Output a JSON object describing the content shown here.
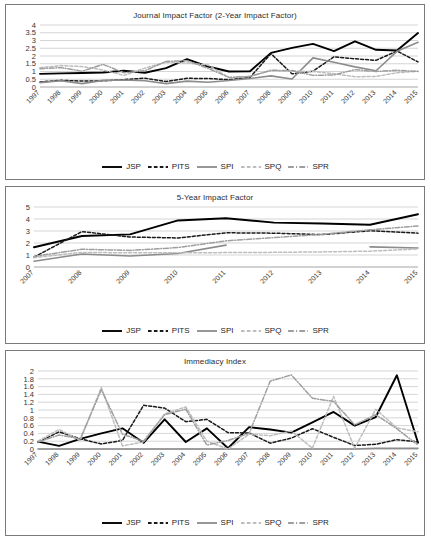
{
  "document": {
    "title": "Journal metrics line charts",
    "background_color": "#ffffff"
  },
  "series_styles": {
    "JSP": {
      "color": "#000000",
      "dash": "none",
      "width": 1.9,
      "legend_label": "JSP"
    },
    "PITS": {
      "color": "#1a1a1a",
      "dash": "dashed",
      "width": 1.5,
      "legend_label": "PITS"
    },
    "SPI": {
      "color": "#8c8c8c",
      "dash": "none",
      "width": 1.6,
      "legend_label": "SPI"
    },
    "SPQ": {
      "color": "#bdbdbd",
      "dash": "dashed",
      "width": 1.5,
      "legend_label": "SPQ"
    },
    "SPR": {
      "color": "#9e9e9e",
      "dash": "dashdot",
      "width": 1.5,
      "legend_label": "SPR"
    }
  },
  "legend": {
    "entries": [
      "JSP",
      "PITS",
      "SPI",
      "SPQ",
      "SPR"
    ]
  },
  "chart_data": [
    {
      "id": "journal-impact-factor",
      "type": "line",
      "title": "Journal Impact Factor (2-Year Impact Factor)",
      "xlabel": "",
      "ylabel": "",
      "ylim": [
        0,
        4
      ],
      "yticks": [
        0,
        0.5,
        1,
        1.5,
        2,
        2.5,
        3,
        3.5,
        4
      ],
      "ytick_labels": [
        "0",
        "0.5",
        "1",
        "1.5",
        "2",
        "2.5",
        "3",
        "3.5",
        "4"
      ],
      "grid": true,
      "legend_position": "bottom",
      "categories": [
        "1997",
        "1998",
        "1999",
        "2000",
        "2001",
        "2002",
        "2003",
        "2004",
        "2005",
        "2006",
        "2007",
        "2008",
        "2009",
        "2010",
        "2011",
        "2012",
        "2013",
        "2014",
        "2015"
      ],
      "series": [
        {
          "name": "JSP",
          "values": [
            0.85,
            0.88,
            0.9,
            0.94,
            1.05,
            0.92,
            1.22,
            1.8,
            1.32,
            1.0,
            1.02,
            2.2,
            2.52,
            2.78,
            2.32,
            2.95,
            2.4,
            2.35,
            3.48
          ]
        },
        {
          "name": "PITS",
          "values": [
            0.33,
            0.43,
            0.38,
            0.4,
            0.48,
            0.57,
            0.35,
            0.56,
            0.55,
            0.47,
            0.62,
            2.15,
            0.85,
            1.02,
            1.95,
            1.82,
            1.72,
            2.32,
            1.62
          ]
        },
        {
          "name": "SPI",
          "values": [
            0.28,
            0.4,
            0.22,
            0.43,
            0.45,
            0.4,
            0.22,
            0.38,
            0.31,
            0.42,
            0.55,
            0.72,
            0.52,
            1.88,
            1.6,
            1.3,
            1.05,
            2.3,
            2.88
          ]
        },
        {
          "name": "SPQ",
          "values": [
            1.25,
            1.38,
            1.32,
            1.1,
            0.75,
            1.22,
            1.6,
            1.55,
            1.42,
            0.6,
            0.7,
            1.05,
            1.02,
            1.0,
            0.86,
            0.66,
            0.68,
            0.92,
            1.02
          ]
        },
        {
          "name": "SPR",
          "values": [
            1.18,
            1.25,
            1.02,
            1.46,
            0.92,
            1.05,
            1.65,
            1.7,
            1.2,
            0.62,
            0.68,
            1.08,
            1.06,
            0.75,
            0.78,
            1.12,
            1.0,
            1.08,
            1.0
          ]
        }
      ]
    },
    {
      "id": "five-year-impact-factor",
      "type": "line",
      "title": "5-Year Impact Factor",
      "xlabel": "",
      "ylabel": "",
      "ylim": [
        0,
        5
      ],
      "yticks": [
        0,
        1,
        2,
        3,
        4,
        5
      ],
      "ytick_labels": [
        "0",
        "1",
        "2",
        "3",
        "4",
        "5"
      ],
      "grid": true,
      "legend_position": "bottom",
      "categories": [
        "2007",
        "2008",
        "2009",
        "2010",
        "2011",
        "2012",
        "2013",
        "2014",
        "2015"
      ],
      "series": [
        {
          "name": "JSP",
          "values": [
            1.65,
            2.58,
            2.72,
            3.88,
            4.06,
            3.7,
            3.62,
            3.52,
            4.4
          ]
        },
        {
          "name": "PITS",
          "values": [
            0.82,
            2.95,
            2.5,
            2.42,
            2.85,
            2.82,
            2.7,
            3.02,
            2.82
          ]
        },
        {
          "name": "SPI",
          "values": [
            0.48,
            1.08,
            0.92,
            1.12,
            1.82,
            null,
            null,
            1.68,
            1.58
          ]
        },
        {
          "name": "SPQ",
          "values": [
            0.78,
            1.22,
            1.18,
            1.18,
            1.2,
            1.22,
            1.26,
            1.32,
            1.5
          ]
        },
        {
          "name": "SPR",
          "values": [
            0.88,
            1.48,
            1.38,
            1.62,
            2.18,
            2.45,
            2.72,
            3.1,
            3.42
          ]
        }
      ]
    },
    {
      "id": "immediacy-index",
      "type": "line",
      "title": "Immediacy Index",
      "xlabel": "",
      "ylabel": "",
      "ylim": [
        0,
        2
      ],
      "yticks": [
        0,
        0.2,
        0.4,
        0.6,
        0.8,
        1,
        1.2,
        1.4,
        1.6,
        1.8,
        2
      ],
      "ytick_labels": [
        "0",
        "0.2",
        "0.4",
        "0.6",
        "0.8",
        "1",
        "1.2",
        "1.4",
        "1.6",
        "1.8",
        "2"
      ],
      "grid": true,
      "legend_position": "bottom",
      "categories": [
        "1997",
        "1998",
        "1999",
        "2000",
        "2001",
        "2002",
        "2003",
        "2004",
        "2005",
        "2006",
        "2007",
        "2008",
        "2009",
        "2010",
        "2011",
        "2012",
        "2013",
        "2014",
        "2015"
      ],
      "series": [
        {
          "name": "JSP",
          "values": [
            0.19,
            0.08,
            0.26,
            0.4,
            0.53,
            0.16,
            0.76,
            0.18,
            0.53,
            0.02,
            0.56,
            0.5,
            0.42,
            0.68,
            0.95,
            0.6,
            0.82,
            1.89,
            0.16
          ]
        },
        {
          "name": "PITS",
          "values": [
            0.17,
            0.44,
            0.26,
            0.13,
            0.22,
            1.12,
            1.05,
            0.7,
            0.76,
            0.42,
            0.41,
            0.15,
            0.28,
            0.52,
            0.3,
            0.09,
            0.12,
            0.24,
            0.18
          ]
        },
        {
          "name": "SPI",
          "values": [
            0.0,
            0.0,
            0.0,
            0.0,
            0.0,
            0.0,
            0.0,
            0.0,
            0.0,
            0.0,
            0.0,
            0.0,
            0.0,
            0.0,
            0.0,
            0.0,
            0.02,
            0.02,
            0.02
          ]
        },
        {
          "name": "SPQ",
          "values": [
            0.2,
            0.5,
            0.22,
            1.58,
            0.08,
            0.18,
            0.9,
            1.08,
            0.2,
            0.0,
            0.38,
            0.34,
            0.46,
            0.02,
            1.35,
            0.02,
            1.02,
            0.54,
            0.44
          ]
        },
        {
          "name": "SPR",
          "values": [
            0.18,
            0.36,
            0.26,
            1.52,
            0.38,
            0.2,
            0.88,
            1.02,
            0.1,
            0.22,
            0.4,
            1.74,
            1.9,
            1.3,
            1.22,
            0.62,
            0.88,
            0.52,
            0.1
          ]
        }
      ]
    }
  ]
}
